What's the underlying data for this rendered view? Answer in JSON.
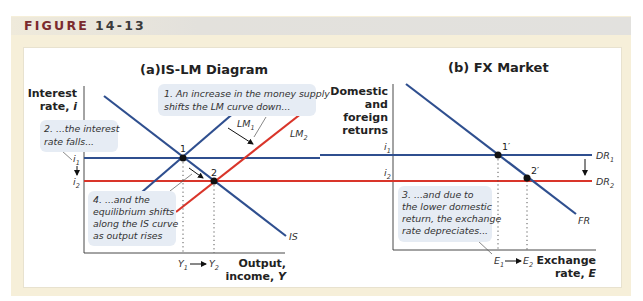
{
  "figure": {
    "label": "FIGURE",
    "number": "14-13"
  },
  "colors": {
    "blue_curve": "#2f4f8f",
    "red_curve": "#d9352a",
    "header_text": "#7b2a2e",
    "callout_bg": "#e6ecf4",
    "frame_bg": "#f6efd9"
  },
  "panel_a": {
    "title": "(a)IS-LM Diagram",
    "y_axis_label": [
      "Interest",
      "rate, i"
    ],
    "x_axis_label": [
      "Output,",
      "income, Y"
    ],
    "i1_label": "i",
    "i1_sub": "1",
    "i2_label": "i",
    "i2_sub": "2",
    "y1_label": "Y",
    "y1_sub": "1",
    "y2_label": "Y",
    "y2_sub": "2",
    "curves": {
      "lm1": "LM",
      "lm1_sub": "1",
      "lm2": "LM",
      "lm2_sub": "2",
      "is": "IS"
    },
    "points": {
      "p1": "1",
      "p2": "2"
    },
    "callouts": {
      "c1": [
        "1. An increase in the money supply",
        "shifts the LM curve down..."
      ],
      "c2": [
        "2. ...the interest",
        "rate falls..."
      ],
      "c4": [
        "4. ...and the",
        "equilibrium shifts",
        "along the IS curve",
        "as output rises"
      ]
    }
  },
  "panel_b": {
    "title": "(b) FX Market",
    "y_axis_label": [
      "Domestic",
      "and",
      "foreign",
      "returns"
    ],
    "x_axis_label": [
      "Exchange",
      "rate, E"
    ],
    "i1_label": "i",
    "i1_sub": "1",
    "i2_label": "i",
    "i2_sub": "2",
    "e1_label": "E",
    "e1_sub": "1",
    "e2_label": "E",
    "e2_sub": "2",
    "curves": {
      "dr1": "DR",
      "dr1_sub": "1",
      "dr2": "DR",
      "dr2_sub": "2",
      "fr": "FR"
    },
    "points": {
      "p1": "1′",
      "p2": "2′"
    },
    "callouts": {
      "c3": [
        "3. ...and due to",
        "the lower domestic",
        "return, the exchange",
        "rate depreciates..."
      ]
    }
  }
}
